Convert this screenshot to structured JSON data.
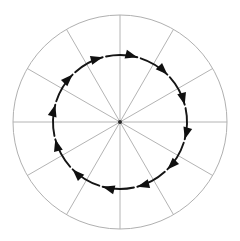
{
  "figure": {
    "name": "clockwise-circular-rotation-diagram",
    "title": "Clockwise circulation around a central point",
    "background_color": "#ffffff",
    "width": 240,
    "height": 241
  },
  "geometry": {
    "center": {
      "x": 120,
      "y": 122
    },
    "outer_circle": {
      "radius": 107,
      "stroke_color": "#b0b0b0",
      "stroke_width": 1,
      "fill": "none"
    },
    "inner_arrow_circle": {
      "radius": 67,
      "stroke_color": "#151515",
      "stroke_width": 1.9,
      "fill": "none"
    },
    "center_dot": {
      "radius": 2.0,
      "color": "#2a2a2a"
    }
  },
  "spokes": {
    "count": 12,
    "stroke_color": "#b4b4b4",
    "stroke_width": 1,
    "inner_radius": 0,
    "outer_radius": 107,
    "angles_deg": [
      0,
      30,
      60,
      90,
      120,
      150,
      180,
      210,
      240,
      270,
      300,
      330
    ]
  },
  "arrows": {
    "count": 12,
    "direction": "clockwise",
    "color": "#101010",
    "head_length": 12,
    "head_width": 9,
    "arc_gap_deg": 3,
    "tip_angles_deg": [
      255,
      285,
      315,
      345,
      15,
      45,
      75,
      105,
      135,
      165,
      195,
      225
    ],
    "description": "Twelve solid triangular arrowheads evenly spaced on the inner circle, all oriented clockwise (tangentially)."
  },
  "labels": {
    "none": ""
  },
  "chart_data": {
    "type": "scatter",
    "title": "Clockwise circulation around a central point",
    "xlabel": "",
    "ylabel": "",
    "xlim": [
      -107,
      107
    ],
    "ylim": [
      -107,
      107
    ],
    "grid": false,
    "legend": "none",
    "series": [
      {
        "name": "outer boundary circle",
        "shape": "circle",
        "radius": 107,
        "center": [
          0,
          0
        ],
        "color": "#b0b0b0"
      },
      {
        "name": "radial spokes",
        "shape": "lines",
        "count": 12,
        "angles_deg": [
          0,
          30,
          60,
          90,
          120,
          150,
          180,
          210,
          240,
          270,
          300,
          330
        ],
        "length": 107,
        "color": "#b4b4b4"
      },
      {
        "name": "clockwise flow circle",
        "shape": "circle",
        "radius": 67,
        "center": [
          0,
          0
        ],
        "color": "#101010",
        "arrow_count": 12,
        "arrow_direction": "clockwise"
      }
    ],
    "annotations": []
  }
}
